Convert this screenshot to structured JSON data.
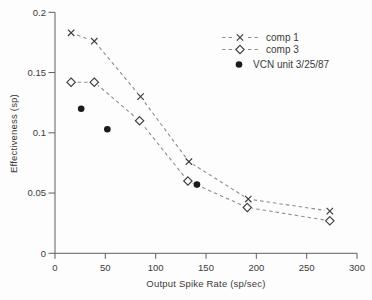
{
  "colors": {
    "background": "#fdfdfd",
    "text": "#3b3b3b",
    "axis": "#5f5f5f",
    "dash": "#8e8e8e",
    "marker": "#3c3c3c",
    "point": "#1b1b1b"
  },
  "chart_data": {
    "type": "line",
    "title": "",
    "xlabel": "Output Spike Rate (sp/sec)",
    "ylabel": "Effectiveness (sp)",
    "xlim": [
      0,
      300
    ],
    "ylim": [
      0,
      0.2
    ],
    "x_ticks": [
      0,
      50,
      100,
      150,
      200,
      250,
      300
    ],
    "x_tick_labels": [
      "0",
      "50",
      "100",
      "150",
      "200",
      "250",
      "300"
    ],
    "y_ticks": [
      0,
      0.05,
      0.1,
      0.15,
      0.2
    ],
    "y_tick_labels": [
      "0",
      "0.05",
      "0.1",
      "0.15",
      "0.2"
    ],
    "grid": false,
    "legend_position": "top-right",
    "series": [
      {
        "name": "comp 1",
        "marker": "x",
        "line": "dashed",
        "points": [
          [
            16,
            0.183
          ],
          [
            39,
            0.176
          ],
          [
            85,
            0.13
          ],
          [
            133,
            0.076
          ],
          [
            192,
            0.045
          ],
          [
            273,
            0.035
          ]
        ]
      },
      {
        "name": "comp 3",
        "marker": "diamond",
        "line": "dashed",
        "points": [
          [
            16,
            0.142
          ],
          [
            39,
            0.142
          ],
          [
            84,
            0.11
          ],
          [
            132,
            0.06
          ],
          [
            191,
            0.038
          ],
          [
            273,
            0.027
          ]
        ]
      },
      {
        "name": "VCN unit 3/25/87",
        "marker": "filled-circle",
        "line": "none",
        "points": [
          [
            26,
            0.12
          ],
          [
            52,
            0.103
          ],
          [
            141,
            0.057
          ]
        ]
      }
    ]
  }
}
